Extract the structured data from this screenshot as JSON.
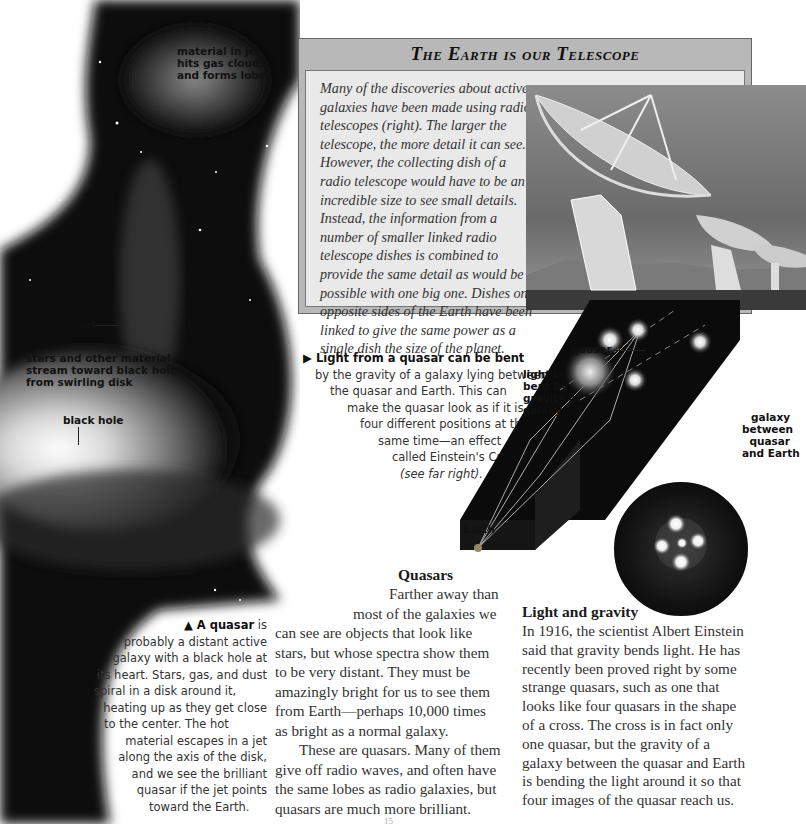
{
  "galaxy_illustration": {
    "labels": {
      "lobes": [
        "material in jet",
        "hits gas clouds",
        "and forms lobes"
      ],
      "jet": "jet",
      "stream": [
        "stars and other material",
        "stream toward black hole",
        "from swirling disk"
      ],
      "black_hole": "black hole"
    },
    "caption": {
      "marker": "▲",
      "bold": "A quasar",
      "lines": [
        " is",
        "probably a distant active",
        "galaxy with a black hole at",
        "its heart. Stars, gas, and dust",
        "spiral in a disk around it,",
        "heating up as they get close",
        "to the center. The hot",
        "material escapes in a jet",
        "along the axis of the disk,",
        "and we see the brilliant",
        "quasar if the jet points",
        "toward the Earth."
      ]
    }
  },
  "feature_box": {
    "title": "The Earth is our Telescope",
    "lines": [
      "Many of the discoveries about active",
      "galaxies have been made using radio",
      "telescopes (right). The larger the",
      "telescope, the more detail it can see.",
      "However, the collecting dish of a",
      "radio telescope would have to be an",
      "incredible size to see small details.",
      "Instead, the information from a",
      "number of smaller linked radio",
      "telescope dishes is combined to",
      "provide the same detail as would be",
      "possible with one big one. Dishes on",
      "opposite sides of the Earth have been",
      "linked to give the same power as a",
      "single dish the size of the planet."
    ],
    "image": "radio-telescope-array-photo"
  },
  "lensing_caption": {
    "marker": "▶",
    "bold": "Light from a quasar can be bent",
    "lines": [
      "by the gravity of a galaxy lying between",
      "the quasar and Earth. This can",
      "make the quasar look as if it is in",
      "four different positions at the",
      "same time—an effect",
      "called Einstein's Cross",
      "(see far right)."
    ]
  },
  "lensing_diagram": {
    "labels": {
      "quasar": "quasar",
      "light_bent": [
        "light is",
        "bent by",
        "gravity of",
        "galaxy"
      ],
      "galaxy_between": [
        "galaxy",
        "between",
        "quasar",
        "and Earth"
      ],
      "earth": "Earth"
    }
  },
  "quasars_section": {
    "heading": "Quasars",
    "lines": [
      "Farther away than",
      "most of the galaxies we",
      "can see are objects that look like",
      "stars, but whose spectra show them",
      "to be very distant. They must be",
      "amazingly bright for us to see them",
      "from Earth—perhaps 10,000 times",
      "as bright as a normal galaxy.",
      "These are quasars. Many of them",
      "give off radio waves, and often have",
      "the same lobes as radio galaxies, but",
      "quasars are much more brilliant."
    ]
  },
  "gravity_section": {
    "heading": "Light and gravity",
    "lines": [
      "In 1916, the scientist Albert Einstein",
      "said that gravity bends light. He has",
      "recently been proved right by some",
      "strange quasars, such as one that",
      "looks like four quasars in the shape",
      "of a cross. The cross is in fact only",
      "one quasar, but the gravity of a",
      "galaxy between the quasar and Earth",
      "is bending the light around it so that",
      "four images of the quasar reach us."
    ]
  },
  "page_number": "15"
}
